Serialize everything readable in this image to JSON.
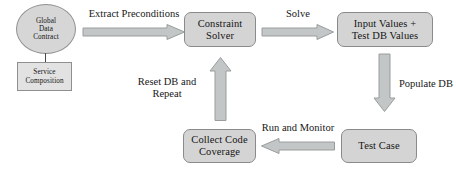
{
  "diagram": {
    "background_color": "#ffffff",
    "node_fill": "#d4d4d4",
    "node_border": "#8a8a8a",
    "arrow_fill": "#c3c6c6",
    "arrow_border": "#9a9d9d",
    "text_color": "#141414"
  },
  "nodes": [
    {
      "id": "global-data-contract",
      "label": "Global\nData\nContract",
      "shape": "ellipse"
    },
    {
      "id": "service-composition",
      "label": "Service\nComposition",
      "shape": "rectangle"
    },
    {
      "id": "constraint-solver",
      "label": "Constraint\nSolver",
      "shape": "rounded-rectangle"
    },
    {
      "id": "input-values",
      "label": "Input Values +\nTest DB Values",
      "shape": "rounded-rectangle"
    },
    {
      "id": "test-case",
      "label": "Test Case",
      "shape": "rounded-rectangle"
    },
    {
      "id": "collect-code-coverage",
      "label": "Collect Code\nCoverage",
      "shape": "rounded-rectangle"
    }
  ],
  "edges": [
    {
      "id": "extract-preconditions",
      "label": "Extract Preconditions",
      "from": "global-data-contract",
      "to": "constraint-solver",
      "direction": "right"
    },
    {
      "id": "solve",
      "label": "Solve",
      "from": "constraint-solver",
      "to": "input-values",
      "direction": "right"
    },
    {
      "id": "populate-db",
      "label": "Populate DB",
      "from": "input-values",
      "to": "test-case",
      "direction": "down"
    },
    {
      "id": "run-and-monitor",
      "label": "Run and Monitor",
      "from": "test-case",
      "to": "collect-code-coverage",
      "direction": "left"
    },
    {
      "id": "reset-db-and-repeat",
      "label": "Reset DB and\nRepeat",
      "from": "collect-code-coverage",
      "to": "constraint-solver",
      "direction": "up"
    }
  ],
  "connectors": [
    {
      "id": "contract-to-composition",
      "from": "global-data-contract",
      "to": "service-composition"
    }
  ]
}
